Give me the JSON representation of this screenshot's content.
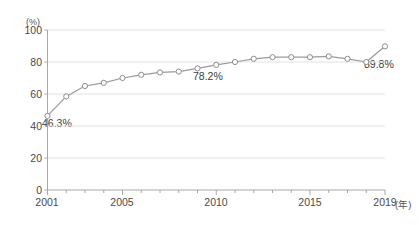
{
  "chart_data": {
    "type": "line",
    "title": "",
    "subtitle": "",
    "xlabel": "(年)",
    "ylabel": "(%)",
    "xlim": [
      2001,
      2019
    ],
    "ylim": [
      0,
      100
    ],
    "grid": true,
    "legend_position": "none",
    "y_ticks": [
      0,
      20,
      40,
      60,
      80,
      100
    ],
    "y_tick_labels": [
      "0",
      "20",
      "40",
      "60",
      "80",
      "100"
    ],
    "x_ticks": [
      2001,
      2005,
      2010,
      2015,
      2019
    ],
    "x_tick_labels": [
      "2001",
      "2005",
      "2010",
      "2015",
      "2019"
    ],
    "x_minor_ticks": [
      2002,
      2003,
      2004,
      2006,
      2007,
      2008,
      2009,
      2011,
      2012,
      2013,
      2014,
      2016,
      2017,
      2018
    ],
    "marker": "open-circle",
    "line_color": "#9a9a9a",
    "marker_edge_color": "#8e8e8e",
    "marker_face_color": "#ffffff",
    "grid_color": "#e2e2e2",
    "axis_color": "#a8a8a8",
    "x": [
      2001,
      2002,
      2003,
      2004,
      2005,
      2006,
      2007,
      2008,
      2009,
      2010,
      2011,
      2012,
      2013,
      2014,
      2015,
      2016,
      2017,
      2018,
      2019
    ],
    "values": [
      46.3,
      58.5,
      65.0,
      67.0,
      70.0,
      72.0,
      73.5,
      74.0,
      76.0,
      78.2,
      80.0,
      82.0,
      83.0,
      83.0,
      83.0,
      83.5,
      82.0,
      80.0,
      89.8
    ],
    "annotations": [
      {
        "label": "46.3%",
        "year": 2001,
        "value": 46.3
      },
      {
        "label": "78.2%",
        "year": 2010,
        "value": 78.2
      },
      {
        "label": "89.8%",
        "year": 2019,
        "value": 89.8
      }
    ]
  }
}
